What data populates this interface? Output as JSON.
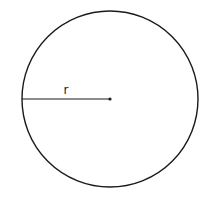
{
  "diagram": {
    "type": "circle-radius",
    "circle": {
      "cx": 110,
      "cy": 99,
      "r": 88,
      "stroke": "#1a1a1a",
      "stroke_width": 1.4
    },
    "radius_line": {
      "x1": 22,
      "y1": 99,
      "x2": 110,
      "y2": 99,
      "stroke": "#1a1a1a",
      "stroke_width": 1.2
    },
    "center_point": {
      "cx": 110,
      "cy": 99,
      "r": 1.6
    },
    "label": {
      "text": "r",
      "x": 66,
      "y": 94
    }
  }
}
